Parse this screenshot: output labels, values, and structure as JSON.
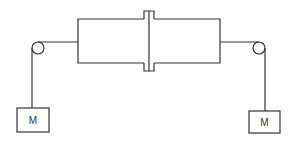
{
  "diagram": {
    "type": "pulley-system",
    "colors": {
      "line": "#333333",
      "background": "#ffffff"
    },
    "left_mass": {
      "label": "M"
    },
    "right_mass": {
      "label": "M"
    }
  }
}
